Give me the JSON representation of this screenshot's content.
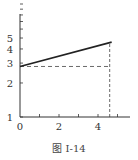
{
  "figure": {
    "caption": "图 I-14"
  },
  "chart_data": {
    "type": "line",
    "title": "",
    "caption": "图 I-14",
    "xlabel": "",
    "ylabel": "",
    "yscale": "log",
    "xlim": [
      0,
      5.8
    ],
    "ylim": [
      1,
      10
    ],
    "x_ticks": [
      0,
      1,
      2,
      3,
      4,
      5
    ],
    "x_tick_labels": [
      "0",
      "2",
      "4"
    ],
    "y_ticks": [
      1,
      2,
      3,
      4,
      5,
      6,
      7,
      8,
      9,
      10
    ],
    "y_tick_labels": [
      "1",
      "2",
      "3",
      "4",
      "5"
    ],
    "grid": false,
    "series": [
      {
        "name": "line",
        "x": [
          0,
          4.7
        ],
        "y": [
          2.8,
          4.6
        ],
        "style": "solid"
      }
    ],
    "annotations": [
      {
        "type": "hline-dashed",
        "y": 2.8,
        "x_from": 0,
        "x_to": 4.6
      },
      {
        "type": "vline-dashed",
        "x": 4.6,
        "y_from": 1,
        "y_to": 4.55
      }
    ]
  }
}
